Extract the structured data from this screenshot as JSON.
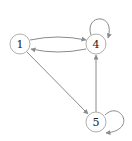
{
  "graph": {
    "type": "directed",
    "nodes": [
      {
        "id": "1",
        "label": "1"
      },
      {
        "id": "4",
        "label": "4"
      },
      {
        "id": "5",
        "label": "5"
      }
    ],
    "edges": [
      {
        "from": "1",
        "to": "4"
      },
      {
        "from": "4",
        "to": "1"
      },
      {
        "from": "4",
        "to": "4"
      },
      {
        "from": "1",
        "to": "5"
      },
      {
        "from": "5",
        "to": "4"
      },
      {
        "from": "5",
        "to": "5"
      }
    ]
  },
  "colors": {
    "edge": "#8a8a8a",
    "node_stroke": "#b0b0b0",
    "node_fill": "#ffffff",
    "text": "#222222"
  }
}
